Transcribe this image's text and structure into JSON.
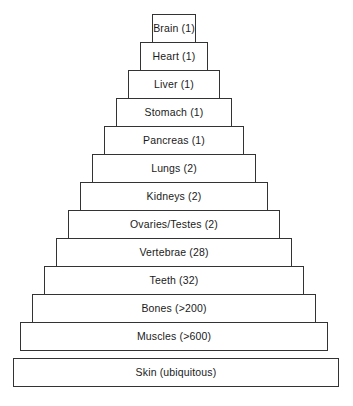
{
  "figure": {
    "title": "",
    "background_color": "#ffffff",
    "box_fill_color": "#ffffff",
    "box_border_color": "#333333",
    "text_color": "#1a1a1a"
  },
  "chart_data": {
    "type": "bar",
    "orientation": "pyramid-steps",
    "title": "",
    "xlabel": "",
    "ylabel": "",
    "categories": [
      "Brain",
      "Heart",
      "Liver",
      "Stomach",
      "Pancreas",
      "Lungs",
      "Kidneys",
      "Ovaries/Testes",
      "Vertebrae",
      "Teeth",
      "Bones",
      "Muscles",
      "Skin"
    ],
    "counts": [
      "1",
      "1",
      "1",
      "1",
      "1",
      "2",
      "2",
      "2",
      "28",
      "32",
      ">200",
      ">600",
      "ubiquitous"
    ],
    "labels": [
      "Brain (1)",
      "Heart (1)",
      "Liver (1)",
      "Stomach (1)",
      "Pancreas (1)",
      "Lungs (2)",
      "Kidneys (2)",
      "Ovaries/Testes (2)",
      "Vertebrae (28)",
      "Teeth (32)",
      "Bones (>200)",
      "Muscles (>600)",
      "Skin (ubiquitous)"
    ],
    "grid": false,
    "legend": "none"
  },
  "levels": [
    {
      "label": "Brain (1)",
      "left": 152,
      "width": 44,
      "top": 14,
      "height": 29
    },
    {
      "label": "Heart (1)",
      "left": 140,
      "width": 68,
      "top": 42,
      "height": 29
    },
    {
      "label": "Liver (1)",
      "left": 128,
      "width": 92,
      "top": 70,
      "height": 29
    },
    {
      "label": "Stomach (1)",
      "left": 116,
      "width": 116,
      "top": 98,
      "height": 29
    },
    {
      "label": "Pancreas (1)",
      "left": 104,
      "width": 140,
      "top": 126,
      "height": 29
    },
    {
      "label": "Lungs (2)",
      "left": 92,
      "width": 164,
      "top": 154,
      "height": 29
    },
    {
      "label": "Kidneys (2)",
      "left": 80,
      "width": 188,
      "top": 182,
      "height": 29
    },
    {
      "label": "Ovaries/Testes (2)",
      "left": 68,
      "width": 212,
      "top": 210,
      "height": 29
    },
    {
      "label": "Vertebrae (28)",
      "left": 56,
      "width": 236,
      "top": 238,
      "height": 29
    },
    {
      "label": "Teeth (32)",
      "left": 44,
      "width": 260,
      "top": 266,
      "height": 29
    },
    {
      "label": "Bones (>200)",
      "left": 32,
      "width": 284,
      "top": 294,
      "height": 29
    },
    {
      "label": "Muscles (>600)",
      "left": 20,
      "width": 308,
      "top": 322,
      "height": 29
    },
    {
      "label": "Skin (ubiquitous)",
      "left": 13,
      "width": 326,
      "top": 358,
      "height": 29
    }
  ]
}
